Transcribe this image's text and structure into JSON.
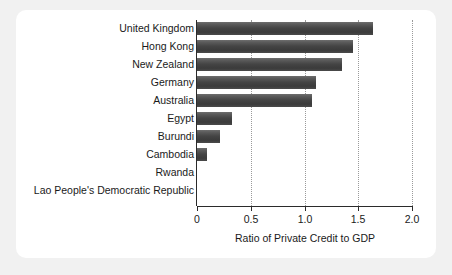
{
  "chart_data": {
    "type": "bar",
    "orientation": "horizontal",
    "title": "",
    "xlabel": "Ratio of Private Credit to GDP",
    "ylabel": "",
    "xlim": [
      0,
      2.0
    ],
    "xticks": [
      "0",
      "0.5",
      "1.0",
      "1.5",
      "2.0"
    ],
    "xtick_values": [
      0,
      0.5,
      1.0,
      1.5,
      2.0
    ],
    "gridlines": "vertical dotted at 0.5, 1.0, 1.5, 2.0",
    "legend": "none",
    "categories": [
      "United Kingdom",
      "Hong Kong",
      "New Zealand",
      "Germany",
      "Australia",
      "Egypt",
      "Burundi",
      "Cambodia",
      "Rwanda",
      "Lao People's Democratic Republic"
    ],
    "values": [
      1.64,
      1.45,
      1.35,
      1.11,
      1.07,
      0.33,
      0.21,
      0.09,
      0.0,
      0.0
    ],
    "bar_color": "#444444",
    "axis_color": "#2b2b2b",
    "grid_color": "#9a9a9a",
    "panel_background": "#ffffff",
    "figure_background": "#f1f1f1"
  }
}
